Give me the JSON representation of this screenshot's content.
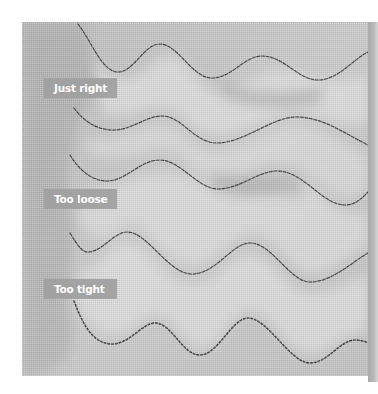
{
  "image": {
    "subject": "quilted fabric sample showing stitched wavy lines with thread tension comparisons",
    "colors": {
      "fabric": "#c8c8c8",
      "fabric_light": "#e4e4e4",
      "fabric_shadow": "#9a9a9a",
      "stitch": "#3a3a3a",
      "label_bg": "#a0a0a0",
      "label_text": "#ffffff",
      "edge_strip": "#b0b0b0"
    }
  },
  "labels": [
    {
      "text": "Just right"
    },
    {
      "text": "Too loose"
    },
    {
      "text": "Too tight"
    }
  ],
  "stitch_lines": [
    {
      "name": "curve-1",
      "path": "M 56 2 C 70 20, 80 50, 96 50 C 112 50, 122 22, 138 22 C 156 22, 170 56, 190 56 C 210 56, 222 34, 240 34 C 262 34, 276 58, 296 58 C 316 58, 330 38, 346 30"
    },
    {
      "name": "curve-2",
      "path": "M 52 86 C 62 100, 76 108, 91 108 C 110 108, 124 94, 140 94 C 160 94, 172 121, 195 121 C 222 121, 250 95, 274 95 C 300 95, 320 110, 346 123"
    },
    {
      "name": "curve-3",
      "path": "M 48 133 C 58 150, 72 159, 85 159 C 104 159, 118 138, 138 138 C 158 138, 176 167, 196 167 C 218 167, 236 149, 255 149 C 282 149, 300 183, 323 183 C 334 183, 340 176, 346 170"
    },
    {
      "name": "curve-4-too-loose",
      "path": "M 48 211 C 56 224, 60 230, 66 230 C 80 230, 92 210, 105 210 C 126 210, 146 252, 170 252 C 194 252, 210 221, 228 221 C 250 221, 268 260, 288 260 C 310 260, 330 240, 346 231"
    },
    {
      "name": "curve-5-too-tight",
      "path": "M 52 279 C 60 300, 70 322, 90 322 C 108 322, 120 301, 133 301 C 150 301, 160 333, 178 333 C 196 333, 210 296, 226 296 C 246 296, 268 341, 288 341 C 306 341, 318 318, 333 318 C 340 318, 344 320, 346 321"
    }
  ]
}
